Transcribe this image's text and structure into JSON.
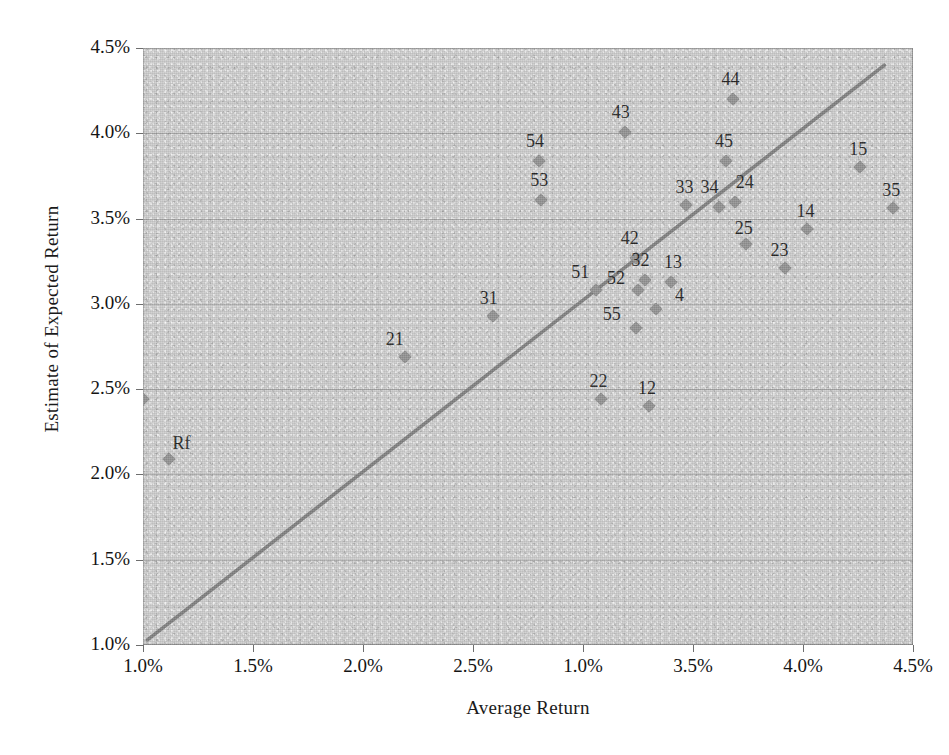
{
  "chart_data": {
    "type": "scatter",
    "title": "",
    "xlabel": "Average Return",
    "ylabel": "Estimate of Expected Return",
    "xlim": [
      1.0,
      4.5
    ],
    "ylim": [
      1.0,
      4.5
    ],
    "grid": true,
    "legend": "none",
    "xticks": [
      "1.0%",
      "1.5%",
      "2.0%",
      "2.5%",
      "1.0%",
      "3.5%",
      "4.0%",
      "4.5%"
    ],
    "xtick_values": [
      1.0,
      1.5,
      2.0,
      2.5,
      3.0,
      3.5,
      4.0,
      4.5
    ],
    "yticks": [
      "1.0%",
      "1.5%",
      "2.0%",
      "2.5%",
      "3.0%",
      "3.5%",
      "4.0%",
      "4.5%"
    ],
    "ytick_values": [
      1.0,
      1.5,
      2.0,
      2.5,
      3.0,
      3.5,
      4.0,
      4.5
    ],
    "points": [
      {
        "label": "11",
        "x": 1.0,
        "y": 2.44
      },
      {
        "label": "Rf",
        "x": 1.12,
        "y": 2.09
      },
      {
        "label": "21",
        "x": 2.19,
        "y": 2.69
      },
      {
        "label": "31",
        "x": 2.59,
        "y": 2.93
      },
      {
        "label": "53",
        "x": 2.81,
        "y": 3.61
      },
      {
        "label": "54",
        "x": 2.8,
        "y": 3.84
      },
      {
        "label": "43",
        "x": 3.19,
        "y": 4.01
      },
      {
        "label": "51",
        "x": 3.06,
        "y": 3.08
      },
      {
        "label": "52",
        "x": 3.25,
        "y": 3.08
      },
      {
        "label": "42",
        "x": 3.24,
        "y": 3.27
      },
      {
        "label": "32",
        "x": 3.28,
        "y": 3.14
      },
      {
        "label": "13",
        "x": 3.4,
        "y": 3.13
      },
      {
        "label": "55",
        "x": 3.24,
        "y": 2.86
      },
      {
        "label": "4",
        "x": 3.33,
        "y": 2.97
      },
      {
        "label": "22",
        "x": 3.08,
        "y": 2.44
      },
      {
        "label": "12",
        "x": 3.3,
        "y": 2.4
      },
      {
        "label": "33",
        "x": 3.47,
        "y": 3.58
      },
      {
        "label": "34",
        "x": 3.62,
        "y": 3.57
      },
      {
        "label": "45",
        "x": 3.65,
        "y": 3.84
      },
      {
        "label": "44",
        "x": 3.68,
        "y": 4.2
      },
      {
        "label": "24",
        "x": 3.69,
        "y": 3.6
      },
      {
        "label": "25",
        "x": 3.74,
        "y": 3.35
      },
      {
        "label": "23",
        "x": 3.92,
        "y": 3.21
      },
      {
        "label": "14",
        "x": 4.02,
        "y": 3.44
      },
      {
        "label": "15",
        "x": 4.26,
        "y": 3.8
      },
      {
        "label": "35",
        "x": 4.41,
        "y": 3.56
      }
    ],
    "trendline": {
      "name": "45-degree reference line",
      "x_start": 1.02,
      "y_start": 1.03,
      "x_end": 4.37,
      "y_end": 4.4,
      "color": "#767676"
    },
    "marker_color": "#8a8a8a",
    "plot_background": "#c9c9c9",
    "gridline_color": "#787878"
  }
}
